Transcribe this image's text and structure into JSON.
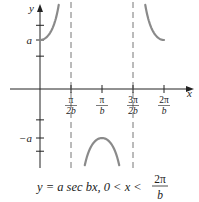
{
  "figure": {
    "axes": {
      "x_label": "x",
      "y_label": "y"
    },
    "y_ticks": [
      {
        "label": "a",
        "value": 1
      },
      {
        "label": "−a",
        "value": -1
      }
    ],
    "x_ticks": [
      {
        "num": "π",
        "den": "2b",
        "value": 0.5
      },
      {
        "num": "π",
        "den": "b",
        "value": 1.0
      },
      {
        "num": "3π",
        "den": "2b",
        "value": 1.5
      },
      {
        "num": "2π",
        "den": "b",
        "value": 2.0
      }
    ],
    "asymptotes": [
      0.5,
      1.5
    ],
    "function": "y = a sec bx",
    "caption": {
      "main": "y = a sec bx, 0 < x < ",
      "frac_num": "2π",
      "frac_den": "b"
    },
    "colors": {
      "curve": "#8a8a8a",
      "axis": "#222222",
      "asymptote": "#777777"
    }
  }
}
